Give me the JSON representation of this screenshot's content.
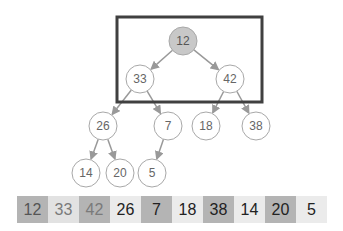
{
  "diagram": {
    "highlight_box": {
      "x": 117,
      "y": 17,
      "w": 145,
      "h": 85,
      "stroke": "#404040"
    },
    "nodes": [
      {
        "id": "n0",
        "label": "12",
        "cx": 183,
        "cy": 41,
        "fill": "#c8c8c8",
        "text": "#555555"
      },
      {
        "id": "n1",
        "label": "33",
        "cx": 140,
        "cy": 79,
        "fill": "#ffffff",
        "text": "#666666"
      },
      {
        "id": "n2",
        "label": "42",
        "cx": 230,
        "cy": 79,
        "fill": "#ffffff",
        "text": "#666666"
      },
      {
        "id": "n3",
        "label": "26",
        "cx": 103,
        "cy": 126,
        "fill": "#ffffff",
        "text": "#666666"
      },
      {
        "id": "n4",
        "label": "7",
        "cx": 168,
        "cy": 126,
        "fill": "#ffffff",
        "text": "#666666"
      },
      {
        "id": "n5",
        "label": "18",
        "cx": 206,
        "cy": 126,
        "fill": "#ffffff",
        "text": "#666666"
      },
      {
        "id": "n6",
        "label": "38",
        "cx": 256,
        "cy": 126,
        "fill": "#ffffff",
        "text": "#666666"
      },
      {
        "id": "n7",
        "label": "14",
        "cx": 86,
        "cy": 173,
        "fill": "#ffffff",
        "text": "#666666"
      },
      {
        "id": "n8",
        "label": "20",
        "cx": 120,
        "cy": 173,
        "fill": "#ffffff",
        "text": "#666666"
      },
      {
        "id": "n9",
        "label": "5",
        "cx": 152,
        "cy": 173,
        "fill": "#ffffff",
        "text": "#666666"
      }
    ],
    "edges": [
      [
        "n0",
        "n1"
      ],
      [
        "n0",
        "n2"
      ],
      [
        "n1",
        "n3"
      ],
      [
        "n1",
        "n4"
      ],
      [
        "n2",
        "n5"
      ],
      [
        "n2",
        "n6"
      ],
      [
        "n3",
        "n7"
      ],
      [
        "n3",
        "n8"
      ],
      [
        "n4",
        "n9"
      ]
    ],
    "array": [
      {
        "label": "12",
        "bg": "#b4b4b4",
        "color": "#555555"
      },
      {
        "label": "33",
        "bg": "#e2e2e2",
        "color": "#7a7a7a"
      },
      {
        "label": "42",
        "bg": "#b4b4b4",
        "color": "#7a7a7a"
      },
      {
        "label": "26",
        "bg": "#ebebeb",
        "color": "#222222"
      },
      {
        "label": "7",
        "bg": "#b4b4b4",
        "color": "#222222"
      },
      {
        "label": "18",
        "bg": "#ebebeb",
        "color": "#222222"
      },
      {
        "label": "38",
        "bg": "#b4b4b4",
        "color": "#222222"
      },
      {
        "label": "14",
        "bg": "#ebebeb",
        "color": "#222222"
      },
      {
        "label": "20",
        "bg": "#b4b4b4",
        "color": "#222222"
      },
      {
        "label": "5",
        "bg": "#ebebeb",
        "color": "#222222"
      }
    ]
  }
}
